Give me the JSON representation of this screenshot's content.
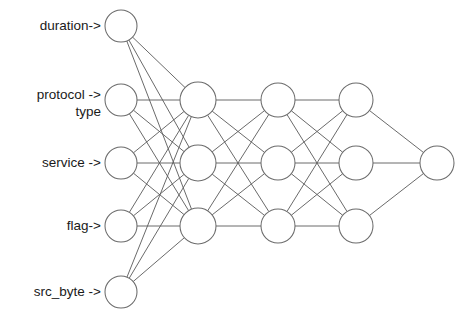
{
  "diagram": {
    "kind": "feed-forward-neural-network",
    "background_color": "#ffffff",
    "node_fill_color": "#ffffff",
    "node_stroke_color": "#6b6b6b",
    "edge_color": "#595959",
    "label_color": "#1a1a1a"
  },
  "input_labels": [
    {
      "id": "duration",
      "text": "duration->",
      "line1": "duration->",
      "line2": ""
    },
    {
      "id": "protocol-type",
      "text": "protocol -> type",
      "line1": "protocol ->",
      "line2": "type"
    },
    {
      "id": "service",
      "text": "service ->",
      "line1": "service ->",
      "line2": ""
    },
    {
      "id": "flag",
      "text": "flag->",
      "line1": "flag->",
      "line2": ""
    },
    {
      "id": "src-byte",
      "text": "src_byte ->",
      "line1": "src_byte ->",
      "line2": ""
    }
  ],
  "layers": [
    {
      "name": "input-layer",
      "index": 0,
      "node_count": 5,
      "radius": 16,
      "nodes": [
        {
          "id": "in-1",
          "cx": 121,
          "cy": 26
        },
        {
          "id": "in-2",
          "cx": 121,
          "cy": 100
        },
        {
          "id": "in-3",
          "cx": 121,
          "cy": 163
        },
        {
          "id": "in-4",
          "cx": 121,
          "cy": 226
        },
        {
          "id": "in-5",
          "cx": 121,
          "cy": 292
        }
      ]
    },
    {
      "name": "hidden-layer-1",
      "index": 1,
      "node_count": 3,
      "radius": 18,
      "nodes": [
        {
          "id": "h1-1",
          "cx": 198,
          "cy": 100
        },
        {
          "id": "h1-2",
          "cx": 198,
          "cy": 163
        },
        {
          "id": "h1-3",
          "cx": 198,
          "cy": 226
        }
      ]
    },
    {
      "name": "hidden-layer-2",
      "index": 2,
      "node_count": 3,
      "radius": 17,
      "nodes": [
        {
          "id": "h2-1",
          "cx": 278,
          "cy": 100
        },
        {
          "id": "h2-2",
          "cx": 278,
          "cy": 163
        },
        {
          "id": "h2-3",
          "cx": 278,
          "cy": 226
        }
      ]
    },
    {
      "name": "hidden-layer-3",
      "index": 3,
      "node_count": 3,
      "radius": 17,
      "nodes": [
        {
          "id": "h3-1",
          "cx": 356,
          "cy": 100
        },
        {
          "id": "h3-2",
          "cx": 356,
          "cy": 163
        },
        {
          "id": "h3-3",
          "cx": 356,
          "cy": 226
        }
      ]
    },
    {
      "name": "output-layer",
      "index": 4,
      "node_count": 1,
      "radius": 17,
      "nodes": [
        {
          "id": "out-1",
          "cx": 437,
          "cy": 163
        }
      ]
    }
  ],
  "label_positions": [
    {
      "id": "duration",
      "x": 101,
      "y": 26
    },
    {
      "id": "protocol-type",
      "x": 101,
      "y": 95
    },
    {
      "id": "service",
      "x": 101,
      "y": 163
    },
    {
      "id": "flag",
      "x": 101,
      "y": 226
    },
    {
      "id": "src-byte",
      "x": 101,
      "y": 292
    }
  ],
  "connections": {
    "input_to_hidden1": "fully-connected",
    "hidden1_to_hidden2": "fully-connected",
    "hidden2_to_hidden3": "fully-connected",
    "hidden3_to_output": "fully-connected",
    "edge_counts": {
      "input_to_hidden1": 15,
      "hidden1_to_hidden2": 9,
      "hidden2_to_hidden3": 9,
      "hidden3_to_output": 3,
      "total": 36
    }
  }
}
